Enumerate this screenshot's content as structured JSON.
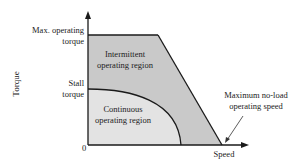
{
  "diagram": {
    "y_axis": {
      "label": "Torque"
    },
    "x_axis": {
      "label": "Speed",
      "origin_label": "0"
    },
    "y_ticks": {
      "max_operating_torque": [
        "Max. operating",
        "torque"
      ],
      "stall_torque": [
        "Stall",
        "torque"
      ]
    },
    "regions": {
      "intermittent": {
        "label": [
          "Intermittent",
          "operating region"
        ],
        "color": "#c9c9c9"
      },
      "continuous": {
        "label": [
          "Continuous",
          "operating region"
        ],
        "color": "#e3e3e3"
      }
    },
    "annotation": {
      "max_no_load_speed": [
        "Maximum no-load",
        "operating speed"
      ]
    },
    "colors": {
      "line": "#1a1a1a",
      "background": "#ffffff"
    }
  }
}
